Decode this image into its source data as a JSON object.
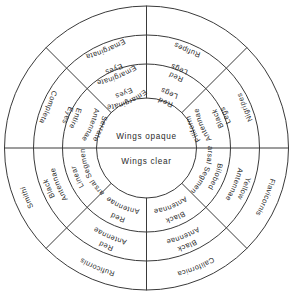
{
  "diagram": {
    "type": "circular-dichotomous-key",
    "geometry": {
      "center_x": 146.5,
      "center_y": 148,
      "radius_outer": 142,
      "radius_ring3_inner": 113,
      "radius_ring2_inner": 84,
      "radius_center_circle": 50
    },
    "stroke_color": "#3a3a3a",
    "background_color": "#ffffff",
    "center": {
      "top_label": "Wings opaque",
      "bottom_label": "Wings clear"
    },
    "rings": [
      {
        "name": "inner-ring",
        "level": 1,
        "sectors": [
          {
            "id": "antennae-serrate",
            "label": "Antennae Serrate",
            "lines": [
              "Antennae",
              "Serrate"
            ],
            "start_deg": 180,
            "end_deg": 225
          },
          {
            "id": "eyes-emarginate",
            "label": "Eyes Emarginate",
            "lines": [
              "Eyes",
              "Emarginate"
            ],
            "start_deg": 225,
            "end_deg": 270
          },
          {
            "id": "legs-red",
            "label": "Legs Red",
            "lines": [
              "Legs",
              "Red"
            ],
            "start_deg": 270,
            "end_deg": 315
          },
          {
            "id": "antennae-filiform",
            "label": "Antennae Filiform",
            "lines": [
              "Antennae",
              "Filiform"
            ],
            "start_deg": 315,
            "end_deg": 360
          },
          {
            "id": "tarsal-segments-bilobed",
            "label": "Tarsal Segments Bilobed",
            "lines": [
              "Tarsal Segments",
              "Bilobed"
            ],
            "start_deg": 0,
            "end_deg": 45
          },
          {
            "id": "antennae-black",
            "label": "Antennae Black",
            "lines": [
              "Antennae",
              "Black"
            ],
            "start_deg": 45,
            "end_deg": 90
          },
          {
            "id": "antennae-red",
            "label": "Antennae Red",
            "lines": [
              "Antennae",
              "Red"
            ],
            "start_deg": 90,
            "end_deg": 135
          },
          {
            "id": "tarsal-segments-linear",
            "label": "Tarsal Segments Linear",
            "lines": [
              "Tarsal Segments",
              "Linear"
            ],
            "start_deg": 135,
            "end_deg": 180
          }
        ]
      },
      {
        "name": "middle-ring",
        "level": 2,
        "sectors": [
          {
            "id": "eyes-entire",
            "label": "Eyes Entire",
            "lines": [
              "Eyes",
              "Entire"
            ],
            "start_deg": 180,
            "end_deg": 225
          },
          {
            "id": "eyes-emarginate-2",
            "label": "Eyes Emarginate",
            "lines": [
              "Eyes",
              "Emarginate"
            ],
            "start_deg": 225,
            "end_deg": 270
          },
          {
            "id": "legs-red-2",
            "label": "Legs Red",
            "lines": [
              "Legs",
              "Red"
            ],
            "start_deg": 270,
            "end_deg": 315
          },
          {
            "id": "legs-black",
            "label": "Legs Black",
            "lines": [
              "Legs",
              "Black"
            ],
            "start_deg": 315,
            "end_deg": 360
          },
          {
            "id": "antennae-yellow",
            "label": "Antennae Yellow",
            "lines": [
              "Antennae",
              "Yellow"
            ],
            "start_deg": 0,
            "end_deg": 45
          },
          {
            "id": "antennae-black-2",
            "label": "Antennae Black",
            "lines": [
              "Antennae",
              "Black"
            ],
            "start_deg": 45,
            "end_deg": 90
          },
          {
            "id": "antennae-red-2",
            "label": "Antennae Red",
            "lines": [
              "Antennae",
              "Red"
            ],
            "start_deg": 90,
            "end_deg": 135
          },
          {
            "id": "antennae-black-3",
            "label": "Antennae Black",
            "lines": [
              "Antennae",
              "Black"
            ],
            "start_deg": 135,
            "end_deg": 180
          }
        ]
      },
      {
        "name": "outer-ring",
        "level": 3,
        "sectors": [
          {
            "id": "completa",
            "label": "Completa",
            "lines": [
              "Completa"
            ],
            "start_deg": 180,
            "end_deg": 225
          },
          {
            "id": "emarginata",
            "label": "Emarginata",
            "lines": [
              "Emarginata"
            ],
            "start_deg": 225,
            "end_deg": 270
          },
          {
            "id": "rufipes",
            "label": "Rufipes",
            "lines": [
              "Rufipes"
            ],
            "start_deg": 270,
            "end_deg": 315
          },
          {
            "id": "nigripes",
            "label": "Nigripes",
            "lines": [
              "Nigripes"
            ],
            "start_deg": 315,
            "end_deg": 360
          },
          {
            "id": "flavicornis",
            "label": "Flavicornis",
            "lines": [
              "Flavicornis"
            ],
            "start_deg": 0,
            "end_deg": 45
          },
          {
            "id": "californica",
            "label": "Californica",
            "lines": [
              "Californica"
            ],
            "start_deg": 45,
            "end_deg": 90
          },
          {
            "id": "ruficornis",
            "label": "Ruficornis",
            "lines": [
              "Ruficornis"
            ],
            "start_deg": 90,
            "end_deg": 135
          },
          {
            "id": "smithi",
            "label": "Smithi",
            "lines": [
              "Smithi"
            ],
            "start_deg": 135,
            "end_deg": 180
          }
        ]
      }
    ],
    "spokes_deg": [
      0,
      45,
      90,
      135,
      180,
      225,
      270,
      315
    ],
    "center_divider_deg": [
      0,
      180
    ]
  }
}
